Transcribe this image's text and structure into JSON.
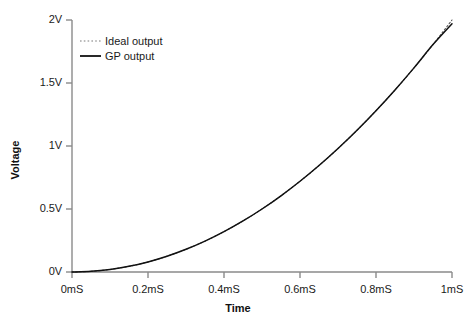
{
  "chart_data": {
    "type": "line",
    "title": "",
    "xlabel": "Time",
    "ylabel": "Voltage",
    "xlim": [
      0,
      1
    ],
    "ylim": [
      0,
      2
    ],
    "grid": false,
    "legend_position": "top-left",
    "xtick_labels": [
      "0mS",
      "0.2mS",
      "0.4mS",
      "0.6mS",
      "0.8mS",
      "1mS"
    ],
    "xtick_values": [
      0,
      0.2,
      0.4,
      0.6,
      0.8,
      1.0
    ],
    "ytick_labels": [
      "0V",
      "0.5V",
      "1V",
      "1.5V",
      "2V"
    ],
    "ytick_values": [
      0,
      0.5,
      1.0,
      1.5,
      2.0
    ],
    "x": [
      0,
      0.05,
      0.1,
      0.15,
      0.2,
      0.25,
      0.3,
      0.35,
      0.4,
      0.45,
      0.5,
      0.55,
      0.6,
      0.65,
      0.7,
      0.75,
      0.8,
      0.85,
      0.9,
      0.95,
      1.0
    ],
    "series": [
      {
        "name": "Ideal output",
        "style": "dotted",
        "color": "#555555",
        "values": [
          0.0,
          0.005,
          0.02,
          0.045,
          0.08,
          0.125,
          0.18,
          0.245,
          0.32,
          0.405,
          0.5,
          0.605,
          0.72,
          0.845,
          0.98,
          1.125,
          1.28,
          1.445,
          1.62,
          1.805,
          2.0
        ]
      },
      {
        "name": "GP output",
        "style": "solid",
        "color": "#111111",
        "values": [
          0.0,
          0.005,
          0.02,
          0.045,
          0.08,
          0.125,
          0.18,
          0.245,
          0.32,
          0.405,
          0.5,
          0.605,
          0.72,
          0.845,
          0.98,
          1.125,
          1.28,
          1.445,
          1.62,
          1.805,
          1.97
        ]
      }
    ]
  },
  "legend": {
    "entries": [
      {
        "label": "Ideal output"
      },
      {
        "label": "GP output"
      }
    ]
  },
  "axes": {
    "x_title": "Time",
    "y_title": "Voltage"
  }
}
